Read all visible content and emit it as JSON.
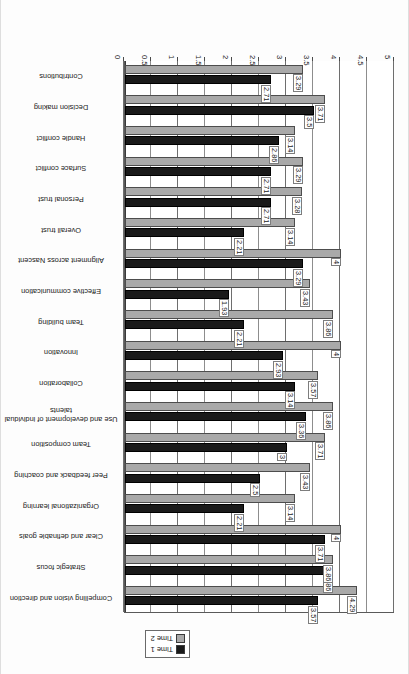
{
  "chart_data": {
    "type": "bar",
    "orientation": "horizontal",
    "title": "",
    "xlabel": "",
    "ylabel": "",
    "xlim": [
      0,
      5
    ],
    "grid": true,
    "legend_position": "top",
    "tick_labels": [
      "0",
      "0.5",
      "1",
      "1.5",
      "2",
      "2.5",
      "3",
      "3.5",
      "4",
      "4.5",
      "5"
    ],
    "tick_values": [
      0,
      0.5,
      1,
      1.5,
      2,
      2.5,
      3,
      3.5,
      4,
      4.5,
      5
    ],
    "categories": [
      "Compelling vision and direction",
      "Strategic focus",
      "Clear and definable goals",
      "Organizational learning",
      "Peer feedback and coaching",
      "Team composition",
      "Use and development of individual talents",
      "Collaboration",
      "Innovation",
      "Team building",
      "Effective communication",
      "Alignment across Nascent",
      "Overall trust",
      "Personal trust",
      "Surface conflict",
      "Handle conflict",
      "Decision making",
      "Contributions"
    ],
    "series": [
      {
        "name": "Time 1",
        "color": "#1a1a1a",
        "values": [
          3.57,
          3.86,
          3.71,
          2.21,
          2.5,
          3,
          3.36,
          3.14,
          2.93,
          2.21,
          1.93,
          3.29,
          2.21,
          2.71,
          2.71,
          2.86,
          3.5,
          2.71
        ],
        "labels": [
          "3.57",
          "3.86",
          "3.71",
          "2.21",
          "2.5",
          "3",
          "3.36",
          "3.14",
          "2.93",
          "2.21",
          "1.93",
          "3.29",
          "2.21",
          "2.71",
          "2.71",
          "2.86",
          "3.5",
          "2.71"
        ]
      },
      {
        "name": "Time 2",
        "color": "#a9a9a9",
        "values": [
          4.29,
          3.86,
          4,
          3.14,
          3.43,
          3.71,
          3.86,
          3.57,
          4,
          3.86,
          3.43,
          4,
          3.14,
          3.28,
          3.29,
          3.14,
          3.71,
          3.29
        ],
        "labels": [
          "4.29",
          "3.86",
          "4",
          "3.14",
          "3.43",
          "3.71",
          "3.86",
          "3.57",
          "4",
          "3.86",
          "3.43",
          "4",
          "3.14",
          "3.28",
          "3.29",
          "3.14",
          "3.71",
          "3.29"
        ]
      }
    ]
  },
  "legend": {
    "items": [
      {
        "label": "Time 1",
        "swatch": "black-square-icon"
      },
      {
        "label": "Time 2",
        "swatch": "gray-square-icon"
      }
    ]
  }
}
